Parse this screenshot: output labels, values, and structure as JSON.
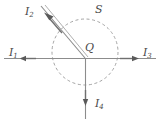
{
  "figure": {
    "type": "physics-current-diagram",
    "colors": {
      "line": "#8c8c8c",
      "dashed_surface": "#9a9a9a",
      "label_text": "#4a4a4a",
      "background": "#ffffff"
    },
    "surface": {
      "name": "S",
      "label": "S",
      "shape": "circle-dashed",
      "center_x": 85,
      "center_y": 52,
      "radius": 33
    },
    "junction": {
      "name": "Q",
      "label": "Q",
      "x": 85,
      "y": 58
    },
    "currents": [
      {
        "id": "I1",
        "label": "I",
        "subscript": "1",
        "direction": "left",
        "arrow_angle_deg": 180,
        "wire_from": [
          4,
          58
        ],
        "wire_to": [
          85,
          58
        ]
      },
      {
        "id": "I2",
        "label": "I",
        "subscript": "2",
        "direction": "up-left",
        "arrow_angle_deg": 130,
        "wire_from": [
          85,
          58
        ],
        "wire_to": [
          41,
          6
        ]
      },
      {
        "id": "I3",
        "label": "I",
        "subscript": "3",
        "direction": "right",
        "arrow_angle_deg": 0,
        "wire_from": [
          85,
          58
        ],
        "wire_to": [
          155,
          58
        ]
      },
      {
        "id": "I4",
        "label": "I",
        "subscript": "4",
        "direction": "down",
        "arrow_angle_deg": 270,
        "wire_from": [
          85,
          58
        ],
        "wire_to": [
          85,
          119
        ]
      }
    ]
  }
}
